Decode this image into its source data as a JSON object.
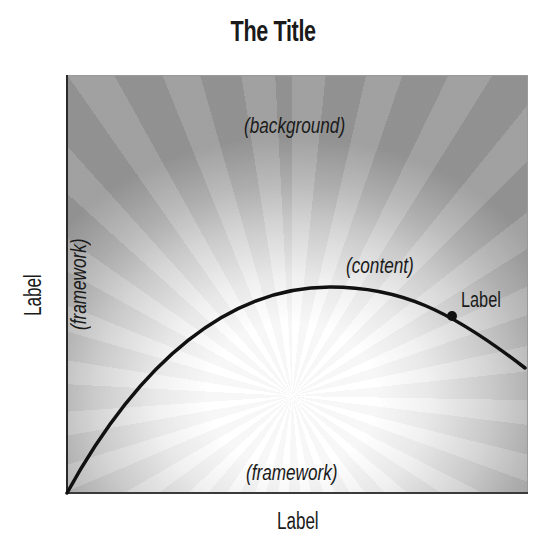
{
  "title": "The Title",
  "plot": {
    "background_label": "(background)",
    "content_label": "(content)",
    "framework_label_bottom": "(framework)",
    "framework_label_left": "(framework)",
    "point_label": "Label"
  },
  "axes": {
    "x_label": "Label",
    "y_label": "Label"
  },
  "colors": {
    "curve": "#111111",
    "axis": "#2a2a2a",
    "background_dark": "#969696",
    "background_light": "#ffffff"
  },
  "curve": {
    "path": "M 67 493 C 140 360, 230 287, 330 287 C 400 287, 450 310, 525 368",
    "marker": {
      "cx": 452,
      "cy": 316,
      "r": 5
    }
  }
}
